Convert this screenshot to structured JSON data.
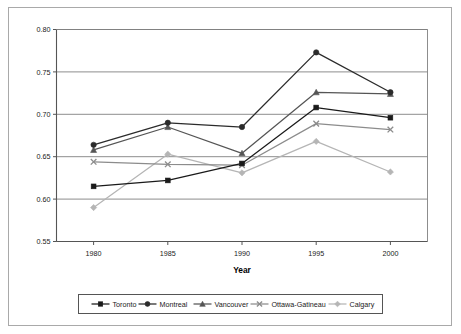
{
  "chart_data": {
    "type": "line",
    "title": "",
    "xlabel": "Year",
    "ylabel": "",
    "categories": [
      "1980",
      "1985",
      "1990",
      "1995",
      "2000"
    ],
    "x": [
      1980,
      1985,
      1990,
      1995,
      2000
    ],
    "xlim": [
      1977.5,
      2002.5
    ],
    "ylim": [
      0.55,
      0.8
    ],
    "yticks": [
      "0.55",
      "0.60",
      "0.65",
      "0.70",
      "0.75",
      "0.80"
    ],
    "ytick_values": [
      0.55,
      0.6,
      0.65,
      0.7,
      0.75,
      0.8
    ],
    "grid": "horizontal",
    "legend_position": "bottom",
    "series": [
      {
        "name": "Toronto",
        "marker": "square",
        "color": "#1a1a1a",
        "values": [
          0.615,
          0.622,
          0.642,
          0.708,
          0.696
        ]
      },
      {
        "name": "Montreal",
        "marker": "circle",
        "color": "#2b2b2b",
        "values": [
          0.664,
          0.69,
          0.685,
          0.773,
          0.726
        ]
      },
      {
        "name": "Vancouver",
        "marker": "triangle",
        "color": "#555555",
        "values": [
          0.658,
          0.685,
          0.654,
          0.726,
          0.724
        ]
      },
      {
        "name": "Ottawa-Gatineau",
        "marker": "x",
        "color": "#8c8c8c",
        "values": [
          0.644,
          0.641,
          0.64,
          0.689,
          0.682
        ]
      },
      {
        "name": "Calgary",
        "marker": "diamond",
        "color": "#b5b5b5",
        "values": [
          0.59,
          0.653,
          0.631,
          0.668,
          0.632
        ]
      }
    ]
  },
  "frame": {
    "border_color": "#a9a9a9",
    "plot_border_color": "#555555",
    "grid_color": "#808080",
    "background": "#ffffff"
  },
  "legend": {
    "border_color": "#555555",
    "items": [
      {
        "label": "Toronto"
      },
      {
        "label": "Montreal"
      },
      {
        "label": "Vancouver"
      },
      {
        "label": "Ottawa-Gatineau"
      },
      {
        "label": "Calgary"
      }
    ]
  }
}
